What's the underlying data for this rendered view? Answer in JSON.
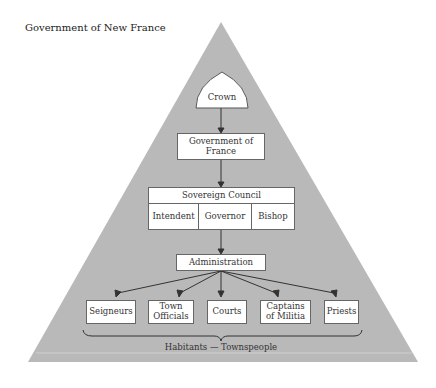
{
  "title": "Government of New France",
  "nodes": {
    "crown": "Crown",
    "government_of_france": "Government of France",
    "sovereign_council": "Sovereign Council",
    "council_members": [
      "Intendent",
      "Governor",
      "Bishop"
    ],
    "administration": "Administration",
    "branches": [
      "Seigneurs",
      "Town Officials",
      "Courts",
      "Captains of Militia",
      "Priests"
    ],
    "base": "Habitants — Townspeople"
  },
  "colors": {
    "pyramid": "#b8b8b8",
    "box_fill": "#ffffff",
    "line": "#333333"
  }
}
